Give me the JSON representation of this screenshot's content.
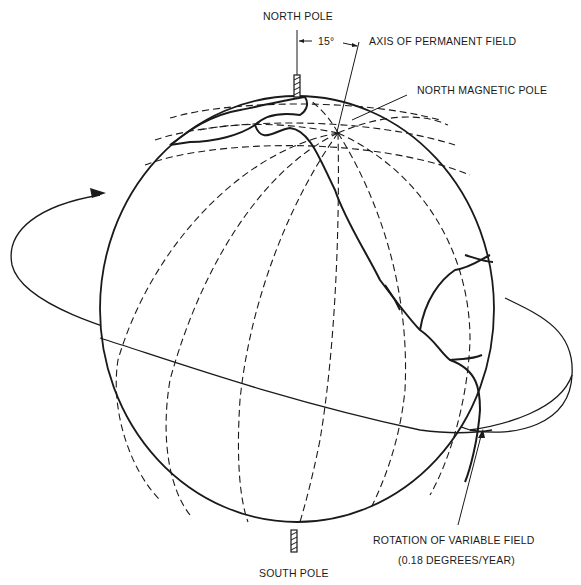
{
  "diagram": {
    "type": "globe-geomagnetic-field",
    "colors": {
      "ink": "#1a1a1a",
      "background": "#ffffff"
    },
    "labels": {
      "north_pole": "NORTH POLE",
      "angle": "15°",
      "axis_permanent_field": "AXIS OF PERMANENT FIELD",
      "north_magnetic_pole": "NORTH MAGNETIC POLE",
      "rotation_variable_field": "ROTATION OF VARIABLE FIELD",
      "rotation_rate": "(0.18 DEGREES/YEAR)",
      "south_pole": "SOUTH POLE"
    },
    "elements": [
      "globe-outline",
      "meridians-dashed",
      "parallels-dashed",
      "continents-americas",
      "rotation-ellipse-with-arrow",
      "geographic-axis-stubs",
      "permanent-field-axis"
    ]
  }
}
